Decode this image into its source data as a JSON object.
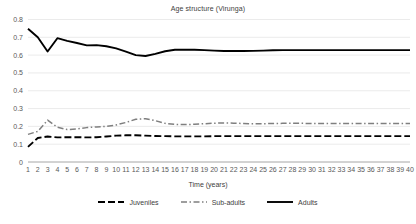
{
  "chart_data": {
    "type": "line",
    "title": "Age structure (Virunga)",
    "xlabel": "Time (years)",
    "ylabel": "",
    "xlim": [
      1,
      40
    ],
    "ylim": [
      0,
      0.8
    ],
    "grid": true,
    "legend_position": "bottom",
    "ytick_labels": [
      "0.8",
      "0.7",
      "0.6",
      "0.5",
      "0.4",
      "0.3",
      "0.2",
      "0.1",
      "0"
    ],
    "ytick_values": [
      0.8,
      0.7,
      0.6,
      0.5,
      0.4,
      0.3,
      0.2,
      0.1,
      0
    ],
    "x": [
      1,
      2,
      3,
      4,
      5,
      6,
      7,
      8,
      9,
      10,
      11,
      12,
      13,
      14,
      15,
      16,
      17,
      18,
      19,
      20,
      21,
      22,
      23,
      24,
      25,
      26,
      27,
      28,
      29,
      30,
      31,
      32,
      33,
      34,
      35,
      36,
      37,
      38,
      39,
      40
    ],
    "xtick_labels": [
      "1",
      "2",
      "3",
      "4",
      "5",
      "6",
      "7",
      "8",
      "9",
      "10",
      "11",
      "12",
      "13",
      "14",
      "15",
      "16",
      "17",
      "18",
      "19",
      "20",
      "21",
      "22",
      "23",
      "24",
      "25",
      "26",
      "27",
      "28",
      "29",
      "30",
      "31",
      "32",
      "33",
      "34",
      "35",
      "36",
      "37",
      "38",
      "39",
      "40"
    ],
    "series": [
      {
        "name": "Juveniles",
        "color": "#000000",
        "style": "dashed",
        "width": 1.9,
        "dash": "7,3",
        "values": [
          0.085,
          0.135,
          0.143,
          0.138,
          0.139,
          0.139,
          0.138,
          0.139,
          0.143,
          0.148,
          0.15,
          0.15,
          0.148,
          0.146,
          0.145,
          0.144,
          0.144,
          0.144,
          0.144,
          0.145,
          0.145,
          0.145,
          0.145,
          0.145,
          0.145,
          0.145,
          0.145,
          0.145,
          0.145,
          0.145,
          0.145,
          0.145,
          0.145,
          0.145,
          0.145,
          0.145,
          0.145,
          0.145,
          0.145,
          0.145
        ]
      },
      {
        "name": "Sub-adults",
        "color": "#7f7f7f",
        "style": "dash-dot",
        "width": 1.5,
        "dash": "6,2.5,1.5,2.5",
        "values": [
          0.155,
          0.172,
          0.235,
          0.195,
          0.182,
          0.186,
          0.193,
          0.197,
          0.2,
          0.208,
          0.222,
          0.24,
          0.243,
          0.232,
          0.217,
          0.211,
          0.21,
          0.212,
          0.215,
          0.218,
          0.219,
          0.218,
          0.216,
          0.215,
          0.215,
          0.216,
          0.217,
          0.217,
          0.217,
          0.216,
          0.216,
          0.216,
          0.216,
          0.216,
          0.216,
          0.216,
          0.216,
          0.216,
          0.216,
          0.216
        ]
      },
      {
        "name": "Adults",
        "color": "#000000",
        "style": "solid",
        "width": 1.9,
        "dash": "",
        "values": [
          0.748,
          0.7,
          0.62,
          0.695,
          0.68,
          0.668,
          0.655,
          0.656,
          0.65,
          0.638,
          0.62,
          0.6,
          0.595,
          0.607,
          0.622,
          0.63,
          0.631,
          0.63,
          0.628,
          0.625,
          0.623,
          0.623,
          0.623,
          0.624,
          0.625,
          0.627,
          0.628,
          0.628,
          0.628,
          0.628,
          0.628,
          0.628,
          0.628,
          0.628,
          0.628,
          0.628,
          0.628,
          0.628,
          0.628,
          0.628
        ]
      }
    ]
  },
  "legend": {
    "items": [
      {
        "label": "Juveniles"
      },
      {
        "label": "Sub-adults"
      },
      {
        "label": "Adults"
      }
    ]
  },
  "colors": {
    "grid": "#e6e6e6",
    "axis": "#a6a6a6",
    "text": "#595959",
    "juveniles": "#000000",
    "subadults": "#7f7f7f",
    "adults": "#000000"
  }
}
